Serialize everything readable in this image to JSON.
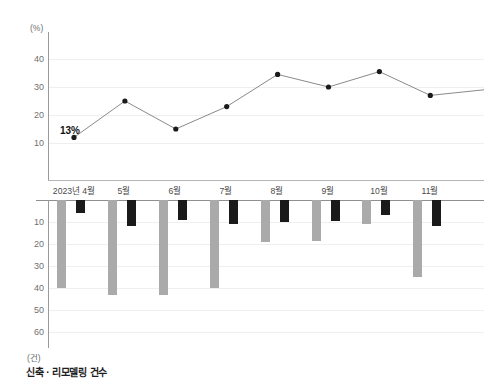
{
  "chart_data": [
    {
      "type": "line",
      "name": "top-line-chart",
      "title": "",
      "xlabel": "",
      "ylabel": "(%)",
      "unit": "(%)",
      "categories": [
        "2023년 4월",
        "5월",
        "6월",
        "7월",
        "8월",
        "9월",
        "10월",
        "11월"
      ],
      "values": [
        12,
        25,
        15,
        23,
        34.5,
        30,
        35.5,
        27
      ],
      "trailing_value": 29,
      "yticks": [
        10,
        20,
        30,
        40
      ],
      "ylim": [
        0,
        48
      ],
      "grid": true,
      "legend": "none",
      "annotations": [
        {
          "label": "13%",
          "category": "2023년 4월",
          "value": 12
        }
      ]
    },
    {
      "type": "bar",
      "name": "bottom-bar-chart",
      "title": "",
      "xlabel": "",
      "ylabel": "(건)",
      "unit": "(건)",
      "orientation": "inverted-downward",
      "categories": [
        "2023년 4월",
        "5월",
        "6월",
        "7월",
        "8월",
        "9월",
        "10월",
        "11월"
      ],
      "series": [
        {
          "name": "신축",
          "color": "#aaaaaa",
          "values": [
            40,
            43,
            43,
            40,
            19,
            18.5,
            11,
            35
          ]
        },
        {
          "name": "리모델링",
          "color": "#1a1a1a",
          "values": [
            6,
            12,
            9,
            11,
            10,
            9.5,
            7,
            12
          ]
        }
      ],
      "yticks": [
        10,
        20,
        30,
        40,
        50,
        60
      ],
      "ylim": [
        0,
        68
      ],
      "grid": true,
      "legend": "none"
    }
  ],
  "top_chart": {
    "unit": "(%)",
    "yticks": [
      "40",
      "30",
      "20",
      "10"
    ],
    "annotation": "13%"
  },
  "bottom_chart": {
    "unit": "(건)",
    "yticks": [
      "10",
      "20",
      "30",
      "40",
      "50",
      "60"
    ]
  },
  "months": [
    "2023년 4월",
    "5월",
    "6월",
    "7월",
    "8월",
    "9월",
    "10월",
    "11월"
  ],
  "caption": "신축 · 리모델링 건수",
  "colors": {
    "gray_bar": "#aaaaaa",
    "black_bar": "#1a1a1a",
    "line": "#8a8a8a",
    "marker": "#1a1a1a",
    "axis": "#9a9a9a",
    "grid": "#efeff0"
  }
}
